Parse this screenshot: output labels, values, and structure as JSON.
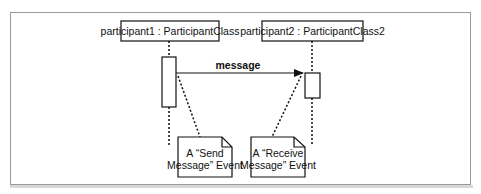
{
  "diagram": {
    "type": "UML sequence diagram",
    "participants": [
      {
        "label": "participant1 : ParticipantClass"
      },
      {
        "label": "participant2 : ParticipantClass2"
      }
    ],
    "message": {
      "label": "message",
      "from": "participant1",
      "to": "participant2"
    },
    "notes": [
      {
        "line1": "A “Send",
        "line2": "Message” Event",
        "attached_to": "message send point"
      },
      {
        "line1": "A “Receive",
        "line2": "Message” Event",
        "attached_to": "message receive point"
      }
    ]
  }
}
